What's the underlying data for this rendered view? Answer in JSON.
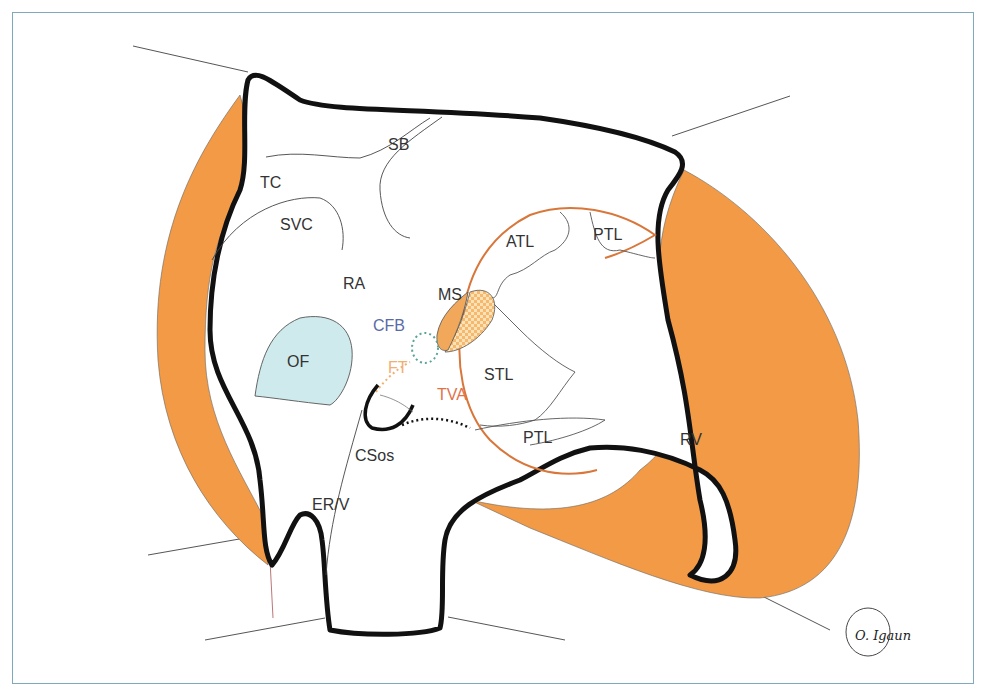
{
  "diagram": {
    "labels": {
      "SB": "SB",
      "TC": "TC",
      "SVC": "SVC",
      "RA": "RA",
      "OF": "OF",
      "CFB": "CFB",
      "FT": "FT",
      "MS": "MS",
      "TVA": "TVA",
      "STL": "STL",
      "ATL": "ATL",
      "PTL_upper": "PTL",
      "PTL_lower": "PTL",
      "RV": "RV",
      "CSos": "CSos",
      "ERV": "ER/V"
    },
    "signature": "O. Igaun",
    "colors": {
      "myocardium_orange": "#f29a45",
      "outline_black": "#111111",
      "fossa_blue": "#cfeaec",
      "tricuspid_orange_line": "#d9763a",
      "cfb_blue_text": "#5a6aa8",
      "cfb_dots": "#5aa39a",
      "ft_orange": "#f0b070",
      "tva_text": "#e2714a",
      "frame_border": "#7fa9bf"
    }
  }
}
